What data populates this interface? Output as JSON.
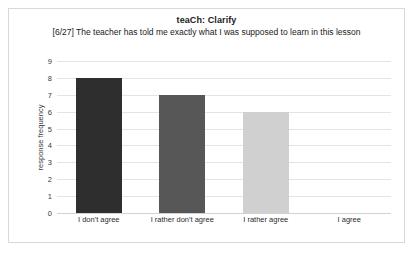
{
  "chart_data": {
    "type": "bar",
    "title": "teaCh: Clarify",
    "subtitle": "[6/27] The teacher has told me exactly what I was supposed to learn in this lesson",
    "categories": [
      "I don't agree",
      "I rather don't agree",
      "I rather agree",
      "I agree"
    ],
    "values": [
      8,
      7,
      6,
      0
    ],
    "bar_colors": [
      "#2e2e2e",
      "#575757",
      "#d0d0d0",
      "#d0d0d0"
    ],
    "xlabel": "",
    "ylabel": "response frequency",
    "ylim": [
      0,
      9
    ],
    "yticks": [
      0,
      1,
      2,
      3,
      4,
      5,
      6,
      7,
      8,
      9
    ],
    "ytick_labels": [
      "0",
      "1",
      "2",
      "3",
      "4",
      "5",
      "6",
      "7",
      "8",
      "9"
    ],
    "grid": true,
    "legend": false,
    "gridline_color": "#e4e4e4",
    "frame_color": "#d9d9d9",
    "background": "#ffffff"
  }
}
